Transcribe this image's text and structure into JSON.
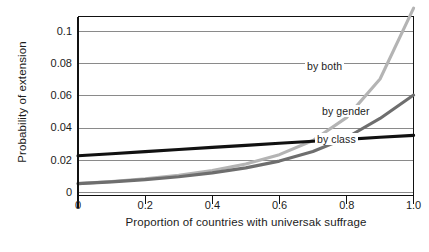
{
  "chart_data": {
    "type": "line",
    "title": "",
    "xlabel": "Proportion of countries with universak suffrage",
    "ylabel": "Probability of extension",
    "xlim": [
      0,
      1.0
    ],
    "ylim": [
      0,
      0.111
    ],
    "grid": true,
    "grid_axis": "y",
    "legend_position": "inline-annotations",
    "x_ticks": [
      "0",
      "0.2",
      "0.4",
      "0.6",
      "0.8",
      "1.0"
    ],
    "x_tick_values": [
      0,
      0.2,
      0.4,
      0.6,
      0.8,
      1.0
    ],
    "y_ticks": [
      "0",
      "0.02",
      "0.04",
      "0.06",
      "0.08",
      "0.1"
    ],
    "y_tick_values": [
      0,
      0.02,
      0.04,
      0.06,
      0.08,
      0.1
    ],
    "x": [
      0,
      0.1,
      0.2,
      0.3,
      0.4,
      0.5,
      0.6,
      0.7,
      0.8,
      0.9,
      1.0
    ],
    "series": [
      {
        "name": "by both",
        "label": "by both",
        "color": "#b4b4b4",
        "values": [
          0.0055,
          0.0068,
          0.0085,
          0.0107,
          0.0136,
          0.0177,
          0.0235,
          0.0323,
          0.0465,
          0.0705,
          0.1145
        ]
      },
      {
        "name": "by gender",
        "label": "by gender",
        "color": "#6e6e6e",
        "values": [
          0.0055,
          0.0066,
          0.008,
          0.0098,
          0.0122,
          0.0153,
          0.0195,
          0.0255,
          0.034,
          0.046,
          0.0605
        ]
      },
      {
        "name": "by class",
        "label": "by class",
        "color": "#111111",
        "values": [
          0.0228,
          0.0241,
          0.0254,
          0.0267,
          0.028,
          0.0293,
          0.0306,
          0.0318,
          0.033,
          0.0343,
          0.0355
        ]
      }
    ],
    "annotations": [
      {
        "text": "by both",
        "x": 0.72,
        "y": 0.0815
      },
      {
        "text": "by gender",
        "x": 0.79,
        "y": 0.0545
      },
      {
        "text": "by class",
        "x": 0.775,
        "y": 0.0318
      }
    ]
  },
  "axis": {
    "line_color": "#111111",
    "grid_color": "#8a8a8a"
  }
}
